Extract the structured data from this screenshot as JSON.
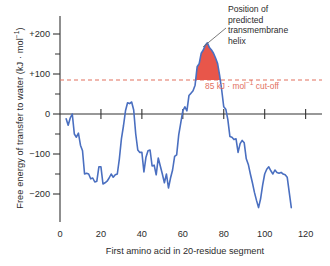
{
  "chart_data": {
    "type": "line",
    "title": "",
    "xlabel": "First amino acid in 20-residue segment",
    "ylabel": "Free energy of transfer to water (kJ · mol⁻¹)",
    "xlim": [
      0,
      128
    ],
    "ylim": [
      -250,
      230
    ],
    "xticks": [
      0,
      20,
      40,
      60,
      80,
      100,
      120
    ],
    "xticklabels": [
      "0",
      "20",
      "40",
      "60",
      "80",
      "100",
      "120"
    ],
    "yticks": [
      -200,
      -100,
      0,
      100,
      200
    ],
    "yticklabels": [
      "−200",
      "−100",
      "0",
      "+100",
      "+200"
    ],
    "yminorticks": [
      -150,
      -50,
      50,
      150
    ],
    "grid": false,
    "legend": null,
    "series": [
      {
        "name": "hydropathy",
        "color": "#4a6fc0",
        "x": [
          3,
          4,
          5,
          6,
          7,
          8,
          9,
          10,
          11,
          12,
          13,
          14,
          15,
          16,
          17,
          18,
          19,
          20,
          21,
          22,
          23,
          24,
          25,
          26,
          27,
          28,
          29,
          30,
          31,
          32,
          33,
          34,
          35,
          36,
          37,
          38,
          39,
          40,
          41,
          42,
          43,
          44,
          45,
          46,
          47,
          48,
          49,
          50,
          51,
          52,
          53,
          54,
          55,
          56,
          57,
          58,
          59,
          60,
          61,
          62,
          63,
          64,
          65,
          66,
          67,
          68,
          69,
          70,
          71,
          72,
          73,
          74,
          75,
          76,
          77,
          78,
          79,
          80,
          81,
          82,
          83,
          84,
          85,
          86,
          87,
          88,
          89,
          90,
          91,
          92,
          93,
          94,
          95,
          96,
          97,
          98,
          99,
          100,
          101,
          102,
          103,
          104,
          105,
          106,
          107,
          108,
          109,
          110,
          111,
          112,
          113
        ],
        "y": [
          -12,
          -28,
          -10,
          0,
          -50,
          -58,
          -48,
          -78,
          -92,
          -150,
          -148,
          -150,
          -162,
          -160,
          -170,
          -168,
          -132,
          -132,
          -175,
          -172,
          -168,
          -160,
          -150,
          -158,
          -152,
          -150,
          -112,
          -62,
          -30,
          8,
          28,
          26,
          30,
          10,
          -50,
          -90,
          -96,
          -96,
          -145,
          -108,
          -92,
          -90,
          -130,
          -128,
          -152,
          -110,
          -130,
          -150,
          -172,
          -150,
          -185,
          -160,
          -140,
          -106,
          -102,
          -52,
          -22,
          8,
          18,
          8,
          46,
          52,
          58,
          72,
          118,
          126,
          152,
          160,
          172,
          178,
          166,
          160,
          152,
          140,
          126,
          96,
          60,
          18,
          12,
          -14,
          -56,
          -58,
          -64,
          -62,
          -96,
          -74,
          -66,
          -72,
          -112,
          -126,
          -150,
          -172,
          -196,
          -216,
          -234,
          -212,
          -178,
          -150,
          -138,
          -132,
          -142,
          -150,
          -140,
          -146,
          -148,
          -146,
          -150,
          -152,
          -158,
          -196,
          -234
        ]
      }
    ],
    "cutoff": {
      "value": 85,
      "color": "#e2705f",
      "style": "dashed",
      "label": "85 kJ · mol⁻¹ cut-off"
    },
    "shaded_region": {
      "label": "Position of predicted transmembrane helix",
      "color": "#e8564a",
      "x_start": 70,
      "x_end": 78,
      "above": 85
    },
    "annotation": {
      "lines": [
        "Position of",
        "predicted",
        "transmembrane",
        "helix"
      ],
      "text": "Position of predicted transmembrane helix"
    }
  },
  "axis": {
    "y_label_text": "Free energy of transfer to water (kJ · mol⁻¹)",
    "x_label_text": "First amino acid in 20-residue segment"
  },
  "colors": {
    "line": "#4a6fc0",
    "fill": "#e8564a",
    "cutoff": "#e2705f",
    "axis": "#333333",
    "text": "#2b2b2b",
    "background": "#ffffff"
  }
}
